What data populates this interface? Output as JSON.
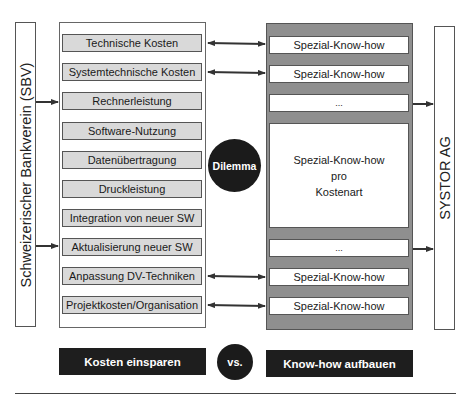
{
  "left_actor": {
    "label": "Schweizerischer Bankverein (SBV)"
  },
  "right_actor": {
    "label": "SYSTOR AG"
  },
  "cost_items": [
    {
      "label": "Technische Kosten"
    },
    {
      "label": "Systemtechnische Kosten"
    },
    {
      "label": "Rechnerleistung"
    },
    {
      "label": "Software-Nutzung"
    },
    {
      "label": "Datenübertragung"
    },
    {
      "label": "Druckleistung"
    },
    {
      "label": "Integration von neuer SW"
    },
    {
      "label": "Aktualisierung neuer SW"
    },
    {
      "label": "Anpassung DV-Techniken"
    },
    {
      "label": "Projektkosten/Organisation"
    }
  ],
  "knowhow_items": [
    {
      "label": "Spezial-Know-how"
    },
    {
      "label": "Spezial-Know-how"
    },
    {
      "label": "..."
    },
    {
      "line1": "Spezial-Know-how",
      "line2": "pro",
      "line3": "Kostenart"
    },
    {
      "label": "..."
    },
    {
      "label": "Spezial-Know-how"
    },
    {
      "label": "Spezial-Know-how"
    }
  ],
  "center": {
    "label": "Dilemma"
  },
  "bottom": {
    "left_label": "Kosten einsparen",
    "vs_label": "vs.",
    "right_label": "Know-how aufbauen"
  },
  "colors": {
    "cost_fill": "#d9d9d9",
    "knowhow_container": "#8f8f8f",
    "dark": "#1b1b1b"
  }
}
